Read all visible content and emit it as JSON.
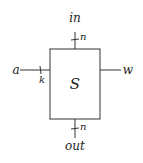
{
  "block": {
    "label": "S"
  },
  "ports": {
    "top": {
      "label": "in",
      "width": "n"
    },
    "bottom": {
      "label": "out",
      "width": "n"
    },
    "left": {
      "label": "a",
      "width": "k"
    },
    "right": {
      "label": "w"
    }
  }
}
